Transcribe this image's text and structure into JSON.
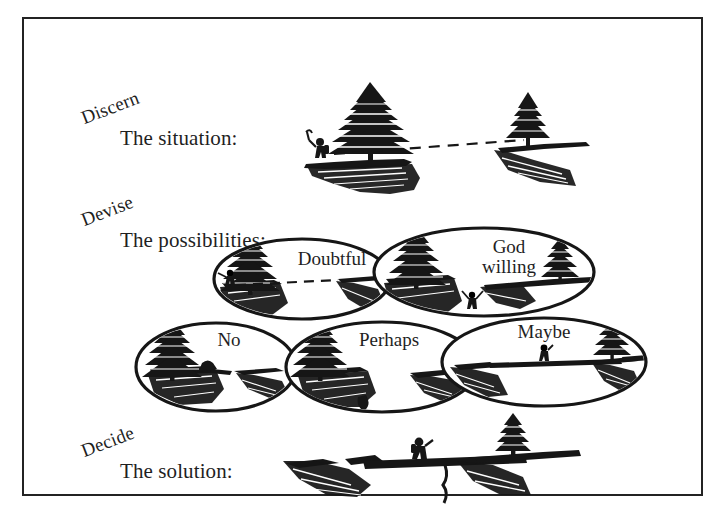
{
  "figure": {
    "frame_color": "#232323",
    "ink_color": "#1a1a1a",
    "background_color": "#ffffff"
  },
  "stages": [
    {
      "key": "discern",
      "word": "Discern",
      "subtitle": "The situation:",
      "illustration": "hiker-at-chasm-edge-with-dashed-sightline"
    },
    {
      "key": "devise",
      "word": "Devise",
      "subtitle": "The possibilities:",
      "illustration": "five-overlapping-ellipse-options"
    },
    {
      "key": "decide",
      "word": "Decide",
      "subtitle": "The solution:",
      "illustration": "hiker-crossing-log-bridge-over-chasm"
    }
  ],
  "possibilities": [
    {
      "key": "doubtful",
      "label": "Doubtful",
      "row": "top",
      "order": 1
    },
    {
      "key": "god-willing",
      "label": "God\nwilling",
      "row": "top",
      "order": 2
    },
    {
      "key": "no",
      "label": "No",
      "row": "bottom",
      "order": 1
    },
    {
      "key": "perhaps",
      "label": "Perhaps",
      "row": "bottom",
      "order": 2
    },
    {
      "key": "maybe",
      "label": "Maybe",
      "row": "bottom",
      "order": 3
    }
  ]
}
